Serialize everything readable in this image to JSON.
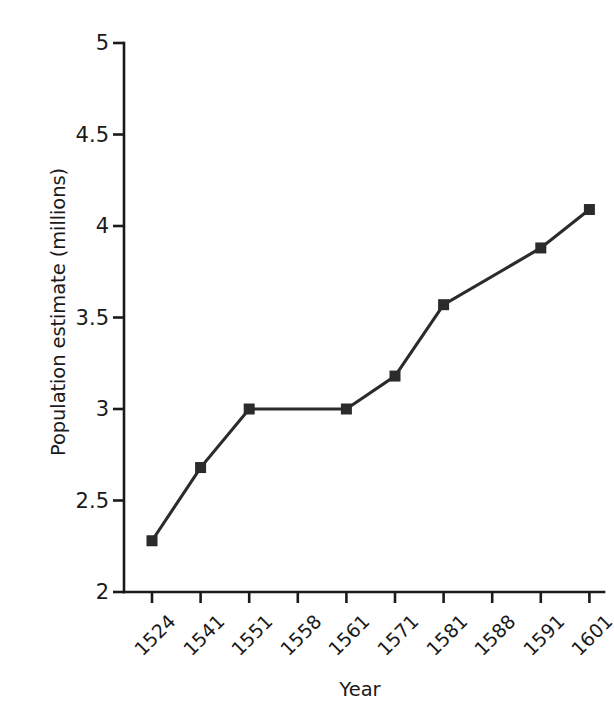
{
  "chart_data": {
    "type": "line",
    "title": "",
    "xlabel": "Year",
    "ylabel": "Population estimate (millions)",
    "categories": [
      "1524",
      "1541",
      "1551",
      "1558",
      "1561",
      "1571",
      "1581",
      "1588",
      "1591",
      "1601"
    ],
    "values": [
      2.28,
      2.68,
      3.0,
      null,
      3.0,
      3.18,
      3.57,
      null,
      3.88,
      4.09
    ],
    "series": [
      {
        "name": "Population estimate",
        "points": [
          {
            "x": "1524",
            "y": 2.28,
            "marker": true
          },
          {
            "x": "1541",
            "y": 2.68,
            "marker": true
          },
          {
            "x": "1551",
            "y": 3.0,
            "marker": true
          },
          {
            "x": "1558",
            "y": null,
            "marker": false
          },
          {
            "x": "1561",
            "y": 3.0,
            "marker": true
          },
          {
            "x": "1571",
            "y": 3.18,
            "marker": true
          },
          {
            "x": "1581",
            "y": 3.57,
            "marker": true
          },
          {
            "x": "1588",
            "y": null,
            "marker": false
          },
          {
            "x": "1591",
            "y": 3.88,
            "marker": true
          },
          {
            "x": "1601",
            "y": 4.09,
            "marker": true
          }
        ]
      }
    ],
    "ylim": [
      2,
      5
    ],
    "yticks": [
      2,
      2.5,
      3,
      3.5,
      4,
      4.5,
      5
    ],
    "ytick_labels": [
      "2",
      "2.5",
      "3",
      "3.5",
      "4",
      "4.5",
      "5"
    ],
    "xtick_labels": [
      "1524",
      "1541",
      "1551",
      "1558",
      "1561",
      "1571",
      "1581",
      "1588",
      "1591",
      "1601"
    ],
    "xtick_rotation": -45,
    "grid": false,
    "legend": false,
    "legend_position": "none",
    "line_color": "#2b2b2b",
    "marker_color": "#2b2b2b",
    "marker_shape": "square",
    "background_color": "#ffffff",
    "axis_color": "#1a1a1a",
    "spines": [
      "left",
      "bottom"
    ]
  },
  "geometry": {
    "plot_left": 124,
    "plot_right": 604,
    "plot_top": 43,
    "plot_bottom": 592,
    "x_positions": [
      152,
      200.6,
      249.2,
      297.8,
      346.4,
      395,
      443.6,
      492.2,
      540.8,
      589.4
    ],
    "marker_size": 11
  }
}
